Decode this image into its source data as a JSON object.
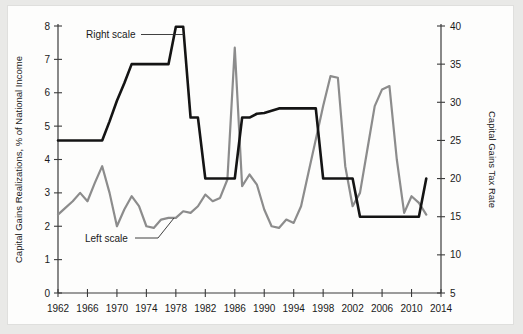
{
  "chart_data": {
    "type": "line",
    "title": "",
    "xlabel": "",
    "xlim": [
      1962,
      2014
    ],
    "x_ticks": [
      1962,
      1966,
      1970,
      1974,
      1978,
      1982,
      1986,
      1990,
      1994,
      1998,
      2002,
      2006,
      2010,
      2014
    ],
    "grid": false,
    "legend_position": "inline-annotations",
    "axes": [
      {
        "id": "left",
        "label": "Capital Gains Realizations, % of National Income",
        "ylim": [
          0,
          8
        ],
        "ticks": [
          0,
          1,
          2,
          3,
          4,
          5,
          6,
          7,
          8
        ],
        "color": "#8c8c8c"
      },
      {
        "id": "right",
        "label": "Capital Gains Tax Rate",
        "ylim": [
          5,
          40
        ],
        "ticks": [
          5,
          10,
          15,
          20,
          25,
          30,
          35,
          40
        ],
        "color": "#1a1a1a"
      }
    ],
    "annotations": [
      {
        "text": "Right scale",
        "target_series": "Capital Gains Tax Rate",
        "x": 1968,
        "y_axis": "right"
      },
      {
        "text": "Left scale",
        "target_series": "Capital Gains Realizations",
        "x": 1975,
        "y_axis": "left"
      }
    ],
    "series": [
      {
        "name": "Capital Gains Realizations",
        "axis": "left",
        "color": "#8c8c8c",
        "stroke_width": 2.2,
        "x": [
          1962,
          1963,
          1964,
          1965,
          1966,
          1967,
          1968,
          1969,
          1970,
          1971,
          1972,
          1973,
          1974,
          1975,
          1976,
          1977,
          1978,
          1979,
          1980,
          1981,
          1982,
          1983,
          1984,
          1985,
          1986,
          1987,
          1988,
          1989,
          1990,
          1991,
          1992,
          1993,
          1994,
          1995,
          1996,
          1997,
          1998,
          1999,
          2000,
          2001,
          2002,
          2003,
          2004,
          2005,
          2006,
          2007,
          2008,
          2009,
          2010,
          2011,
          2012
        ],
        "values": [
          2.35,
          2.55,
          2.75,
          3.0,
          2.75,
          3.3,
          3.8,
          3.0,
          2.0,
          2.5,
          2.9,
          2.6,
          2.0,
          1.95,
          2.2,
          2.25,
          2.25,
          2.45,
          2.4,
          2.6,
          2.95,
          2.75,
          2.85,
          3.4,
          7.35,
          3.2,
          3.55,
          3.25,
          2.5,
          2.0,
          1.95,
          2.2,
          2.1,
          2.6,
          3.6,
          4.6,
          5.6,
          6.5,
          6.45,
          3.8,
          2.6,
          3.0,
          4.3,
          5.6,
          6.1,
          6.2,
          4.0,
          2.4,
          2.9,
          2.7,
          2.35
        ]
      },
      {
        "name": "Capital Gains Tax Rate",
        "axis": "right",
        "color": "#141414",
        "stroke_width": 2.6,
        "x": [
          1962,
          1963,
          1964,
          1965,
          1966,
          1967,
          1968,
          1969,
          1970,
          1971,
          1972,
          1973,
          1974,
          1975,
          1976,
          1977,
          1978,
          1979,
          1980,
          1981,
          1982,
          1983,
          1984,
          1985,
          1986,
          1987,
          1988,
          1989,
          1990,
          1991,
          1992,
          1993,
          1994,
          1995,
          1996,
          1997,
          1998,
          1999,
          2000,
          2001,
          2002,
          2003,
          2004,
          2005,
          2006,
          2007,
          2008,
          2009,
          2010,
          2011,
          2012
        ],
        "values": [
          25,
          25,
          25,
          25,
          25,
          25,
          25,
          27.5,
          30.2,
          32.5,
          35,
          35,
          35,
          35,
          35,
          35,
          39.9,
          39.9,
          28,
          28,
          20,
          20,
          20,
          20,
          20,
          28,
          28,
          28.5,
          28.6,
          28.9,
          29.2,
          29.2,
          29.2,
          29.2,
          29.2,
          29.2,
          20,
          20,
          20,
          20,
          20,
          15,
          15,
          15,
          15,
          15,
          15,
          15,
          15,
          15,
          20
        ]
      }
    ]
  }
}
